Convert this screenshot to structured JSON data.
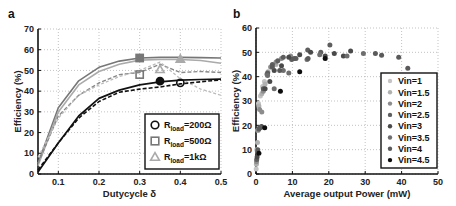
{
  "chart_data": [
    {
      "panel_label": "a",
      "type": "line",
      "title": "",
      "xlabel": "Dutycycle δ",
      "ylabel": "Efficiency (%)",
      "xlim": [
        0.05,
        0.5
      ],
      "ylim": [
        0,
        70
      ],
      "xticks": [
        0.1,
        0.2,
        0.3,
        0.4,
        0.5
      ],
      "xtick_labels": [
        "0.1",
        "0.2",
        "0.3",
        "0.4",
        "0.5"
      ],
      "yticks": [
        0,
        10,
        20,
        30,
        40,
        50,
        60,
        70
      ],
      "ytick_labels": [
        "0",
        "10",
        "20",
        "30",
        "40",
        "50",
        "60",
        "70"
      ],
      "grid": true,
      "legend_position": "lower right",
      "legend": [
        {
          "marker": "circle",
          "label_main": "R",
          "label_sub": "load",
          "label_value": "=200Ω",
          "color": "#111111"
        },
        {
          "marker": "square",
          "label_main": "R",
          "label_sub": "load",
          "label_value": "=500Ω",
          "color": "#777777"
        },
        {
          "marker": "triangle",
          "label_main": "R",
          "label_sub": "load",
          "label_value": "=1kΩ",
          "color": "#aaaaaa"
        }
      ],
      "series": [
        {
          "name": "Rload=500Ω (solid)",
          "color": "#777777",
          "dash": "",
          "width": 1.6,
          "x": [
            0.05,
            0.1,
            0.15,
            0.2,
            0.25,
            0.3,
            0.35,
            0.4,
            0.45,
            0.5
          ],
          "y": [
            5,
            32,
            45,
            51.5,
            54.5,
            56,
            56.3,
            56.3,
            56.2,
            56
          ]
        },
        {
          "name": "Rload=1kΩ (solid)",
          "color": "#aaaaaa",
          "dash": "",
          "width": 1.6,
          "x": [
            0.05,
            0.1,
            0.15,
            0.2,
            0.25,
            0.3,
            0.35,
            0.4,
            0.45,
            0.5
          ],
          "y": [
            4,
            30,
            43,
            49.5,
            53,
            55,
            55.3,
            55.3,
            54.8,
            53.5
          ]
        },
        {
          "name": "Rload=500Ω (dashed)",
          "color": "#888888",
          "dash": "4,2",
          "width": 1.4,
          "x": [
            0.05,
            0.1,
            0.15,
            0.2,
            0.25,
            0.3,
            0.35,
            0.375,
            0.4,
            0.45,
            0.5
          ],
          "y": [
            5,
            28,
            38,
            44,
            48,
            49,
            53,
            51,
            49,
            49.5,
            49
          ]
        },
        {
          "name": "Rload=1kΩ (dashed)",
          "color": "#bbbbbb",
          "dash": "3,2",
          "width": 1.3,
          "x": [
            0.05,
            0.1,
            0.15,
            0.2,
            0.25,
            0.3,
            0.35,
            0.375,
            0.4,
            0.45,
            0.5
          ],
          "y": [
            8,
            27,
            38,
            43,
            47,
            50,
            54,
            50,
            46,
            41,
            38
          ]
        },
        {
          "name": "Rload=200Ω (solid)",
          "color": "#111111",
          "dash": "",
          "width": 1.7,
          "x": [
            0.05,
            0.1,
            0.15,
            0.2,
            0.25,
            0.3,
            0.35,
            0.4,
            0.45,
            0.5
          ],
          "y": [
            1,
            15,
            28,
            36.5,
            40.5,
            43,
            44.5,
            45.3,
            45.6,
            45.8
          ]
        },
        {
          "name": "Rload=200Ω (dashed)",
          "color": "#111111",
          "dash": "4,2",
          "width": 1.6,
          "x": [
            0.05,
            0.1,
            0.15,
            0.2,
            0.25,
            0.3,
            0.35,
            0.4,
            0.45,
            0.5
          ],
          "y": [
            2,
            15,
            27,
            35,
            39.5,
            41,
            42,
            43.5,
            44.5,
            45.5
          ]
        }
      ],
      "markers": [
        {
          "shape": "square",
          "x": 0.3,
          "y": 56,
          "fill": "#777777",
          "stroke": "#777777"
        },
        {
          "shape": "triangle",
          "x": 0.4,
          "y": 55.5,
          "fill": "#aaaaaa",
          "stroke": "#aaaaaa"
        },
        {
          "shape": "square",
          "x": 0.3,
          "y": 48,
          "fill": "none",
          "stroke": "#777777"
        },
        {
          "shape": "triangle",
          "x": 0.35,
          "y": 50.5,
          "fill": "none",
          "stroke": "#aaaaaa"
        },
        {
          "shape": "circle",
          "x": 0.35,
          "y": 44.8,
          "fill": "#111111",
          "stroke": "#111111"
        },
        {
          "shape": "circle",
          "x": 0.4,
          "y": 44,
          "fill": "none",
          "stroke": "#111111"
        }
      ]
    },
    {
      "panel_label": "b",
      "type": "scatter",
      "title": "",
      "xlabel": "Average output Power (mW)",
      "ylabel": "Efficiency (%)",
      "xlim": [
        0,
        50
      ],
      "ylim": [
        0,
        60
      ],
      "xticks": [
        0,
        10,
        20,
        30,
        40,
        50
      ],
      "xtick_labels": [
        "0",
        "10",
        "20",
        "30",
        "40",
        "50"
      ],
      "yticks": [
        0,
        10,
        20,
        30,
        40,
        50,
        60
      ],
      "ytick_labels": [
        "0",
        "10",
        "20",
        "30",
        "40",
        "50",
        "60"
      ],
      "grid": true,
      "legend_position": "lower right",
      "series": [
        {
          "name": "Vin=1",
          "color": "#c4c4c4",
          "points": [
            [
              0.05,
              2
            ],
            [
              0.2,
              10
            ],
            [
              0.5,
              18
            ],
            [
              0.7,
              29
            ],
            [
              1.2,
              32
            ],
            [
              1.8,
              36
            ],
            [
              2.3,
              38
            ]
          ]
        },
        {
          "name": "Vin=1.5",
          "color": "#b0b0b0",
          "points": [
            [
              0.1,
              4
            ],
            [
              0.4,
              13
            ],
            [
              0.8,
              28
            ],
            [
              1.6,
              33
            ],
            [
              2.5,
              37
            ],
            [
              3.3,
              42
            ],
            [
              4.2,
              44
            ],
            [
              5.5,
              45
            ]
          ]
        },
        {
          "name": "Vin=2",
          "color": "#8c8c8c",
          "points": [
            [
              0.15,
              5
            ],
            [
              0.6,
              18
            ],
            [
              1.0,
              26.5
            ],
            [
              1.6,
              25.5
            ],
            [
              2.0,
              34
            ],
            [
              3.0,
              41
            ],
            [
              4.0,
              44
            ],
            [
              5.5,
              46
            ],
            [
              7.0,
              47.5
            ],
            [
              9.5,
              48.5
            ]
          ]
        },
        {
          "name": "Vin=2.5",
          "color": "#5e5e5e",
          "points": [
            [
              0.2,
              6
            ],
            [
              0.8,
              18.5
            ],
            [
              2.0,
              35
            ],
            [
              3.2,
              41.5
            ],
            [
              4.5,
              45
            ],
            [
              6.0,
              46.5
            ],
            [
              7.5,
              48
            ],
            [
              9.8,
              47
            ],
            [
              11.0,
              47.5
            ],
            [
              14.2,
              51
            ],
            [
              17.8,
              50
            ],
            [
              20.3,
              53
            ]
          ]
        },
        {
          "name": "Vin=3",
          "color": "#4a4a4a",
          "points": [
            [
              0.3,
              7
            ],
            [
              1.5,
              19.5
            ],
            [
              2.5,
              35
            ],
            [
              3.8,
              38
            ],
            [
              5.0,
              42.5
            ],
            [
              7.0,
              44.5
            ],
            [
              9.0,
              48
            ],
            [
              12.0,
              49
            ],
            [
              15.0,
              50
            ],
            [
              19.0,
              48.5
            ],
            [
              21.5,
              49.5
            ],
            [
              24.0,
              48.5
            ],
            [
              26.0,
              50.5
            ]
          ]
        },
        {
          "name": "Vin=3.5",
          "color": "#6e6e6e",
          "points": [
            [
              0.4,
              9
            ],
            [
              1.2,
              19
            ],
            [
              3.2,
              40.5
            ],
            [
              5.0,
              35
            ],
            [
              7.5,
              42.5
            ],
            [
              9.0,
              41.5
            ],
            [
              14.0,
              47
            ],
            [
              17.5,
              49
            ],
            [
              25.0,
              48.5
            ],
            [
              29.5,
              49.5
            ]
          ]
        },
        {
          "name": "Vin=4",
          "color": "#5a5a5a",
          "points": [
            [
              0.5,
              10
            ],
            [
              1.0,
              19
            ],
            [
              4.5,
              44
            ],
            [
              6.5,
              42.5
            ],
            [
              10.5,
              47.5
            ],
            [
              14.3,
              47.5
            ],
            [
              32.8,
              49.5
            ],
            [
              34.5,
              48.8
            ],
            [
              39.2,
              48
            ],
            [
              41.7,
              43.5
            ]
          ]
        },
        {
          "name": "Vin=4.5",
          "color": "#0d0d0d",
          "points": [
            [
              0.8,
              8.5
            ],
            [
              2.4,
              19
            ],
            [
              6.7,
              34
            ],
            [
              12.0,
              42
            ],
            [
              19.0,
              47.5
            ]
          ]
        }
      ]
    }
  ]
}
